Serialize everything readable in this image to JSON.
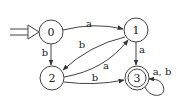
{
  "diagram": {
    "type": "finite-automaton",
    "start_state": "0",
    "accept_states": [
      "3"
    ],
    "states": [
      {
        "id": "0",
        "label": "0",
        "cx": 51,
        "cy": 32,
        "accepting": false
      },
      {
        "id": "1",
        "label": "1",
        "cx": 136,
        "cy": 30,
        "accepting": false
      },
      {
        "id": "2",
        "label": "2",
        "cx": 52,
        "cy": 78,
        "accepting": false
      },
      {
        "id": "3",
        "label": "3",
        "cx": 137,
        "cy": 78,
        "accepting": true
      }
    ],
    "transitions": [
      {
        "from": "0",
        "to": "1",
        "label": "a"
      },
      {
        "from": "0",
        "to": "2",
        "label": "b"
      },
      {
        "from": "1",
        "to": "2",
        "label": "b"
      },
      {
        "from": "2",
        "to": "1",
        "label": "a"
      },
      {
        "from": "1",
        "to": "3",
        "label": "a"
      },
      {
        "from": "2",
        "to": "3",
        "label": "b"
      },
      {
        "from": "3",
        "to": "3",
        "label": "a, b"
      }
    ],
    "colors": {
      "stroke": "#444444",
      "text": "#222222",
      "background": "#ffffff"
    }
  }
}
